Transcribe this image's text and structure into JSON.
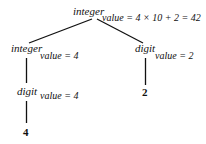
{
  "diagram": {
    "type": "annotated parse tree",
    "root": {
      "label": "integer",
      "attribute": "value = 4 × 10 + 2 = 42",
      "children": [
        {
          "label": "integer",
          "attribute": "value = 4",
          "children": [
            {
              "label": "digit",
              "attribute": "value = 4",
              "children": [
                {
                  "label": "4"
                }
              ]
            }
          ]
        },
        {
          "label": "digit",
          "attribute": "value = 2",
          "children": [
            {
              "label": "2"
            }
          ]
        }
      ]
    },
    "colors": {
      "ink": "#111111",
      "background": "#ffffff"
    }
  }
}
